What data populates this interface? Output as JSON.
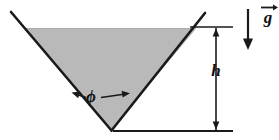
{
  "figure": {
    "type": "technical-diagram",
    "background_color": "#ffffff",
    "line_color": "#1a1a1a",
    "fill_color": "#b8b8b8",
    "labels": {
      "angle": "ϕ",
      "height": "h",
      "gravity": "g"
    },
    "icons": {
      "gravity_vector": "down-arrow-icon",
      "angle_marker": "double-headed-angle-arrow-icon",
      "dimension_marker": "vertical-dimension-arrow-icon"
    },
    "geometry": {
      "wedge_left_top": [
        11,
        12
      ],
      "wedge_right_top": [
        205,
        13
      ],
      "wedge_apex": [
        111,
        130
      ],
      "liquid_surface_y": 28,
      "dimension_line_x": 216,
      "dimension_top_y": 27,
      "dimension_bottom_y": 131,
      "baseline_y": 131,
      "gravity_arrow_x": 248,
      "gravity_arrow_top_y": 8,
      "gravity_arrow_bottom_y": 50
    }
  }
}
